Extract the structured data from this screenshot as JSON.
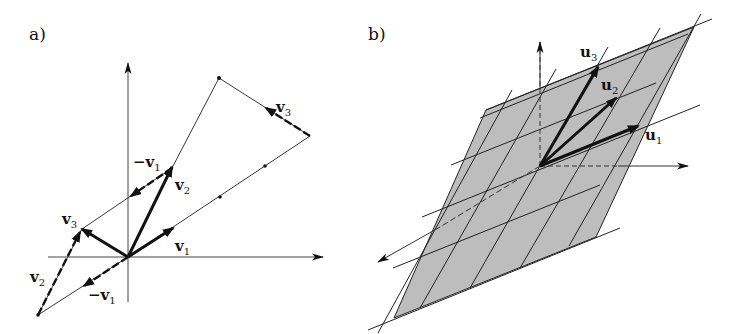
{
  "panels": [
    {
      "label": "a)",
      "vectors": [
        "v1",
        "v2",
        "v3",
        "-v1",
        "v2",
        "-v1",
        "v3"
      ],
      "labels": {
        "v1": {
          "main": "v",
          "sub": "1"
        },
        "v2": {
          "main": "v",
          "sub": "2"
        },
        "v3": {
          "main": "v",
          "sub": "3"
        },
        "neg_v1_top": {
          "main": "−v",
          "sub": "1"
        },
        "neg_v1_bottom": {
          "main": "−v",
          "sub": "1"
        },
        "v2_left": {
          "main": "v",
          "sub": "2"
        },
        "v3_top_right": {
          "main": "v",
          "sub": "3"
        }
      }
    },
    {
      "label": "b)",
      "labels": {
        "u1": {
          "main": "u",
          "sub": "1"
        },
        "u2": {
          "main": "u",
          "sub": "2"
        },
        "u3": {
          "main": "u",
          "sub": "3"
        }
      },
      "plane_color": "#bdbdbd"
    }
  ],
  "colors": {
    "ink": "#111111",
    "background": "#ffffff",
    "plane": "#bdbdbd"
  }
}
